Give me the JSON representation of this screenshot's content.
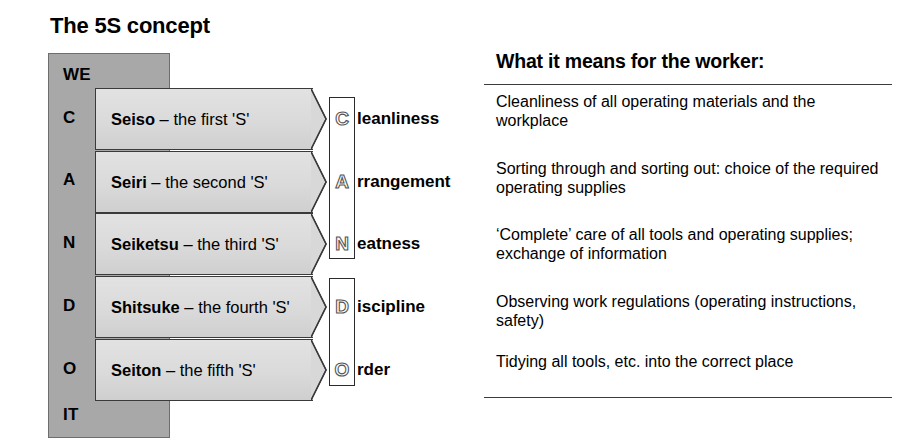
{
  "diagram": {
    "title": "The 5S concept",
    "acrostic_letters": [
      {
        "text": "WE",
        "top": 12
      },
      {
        "text": "C",
        "top": 55
      },
      {
        "text": "A",
        "top": 117
      },
      {
        "text": "N",
        "top": 180
      },
      {
        "text": "D",
        "top": 243
      },
      {
        "text": "O",
        "top": 306
      },
      {
        "text": "IT",
        "top": 352
      }
    ],
    "rows": [
      {
        "term": "Seiso",
        "separator": " – the first 'S'",
        "initial": "C",
        "word_rest": "leanliness",
        "top": 88
      },
      {
        "term": "Seiri",
        "separator": " – the second 'S'",
        "initial": "A",
        "word_rest": "rrangement",
        "top": 151
      },
      {
        "term": "Seiketsu",
        "separator": " – the third 'S'",
        "initial": "N",
        "word_rest": "eatness",
        "top": 213
      },
      {
        "term": "Shitsuke",
        "separator": " – the fourth 'S'",
        "initial": "D",
        "word_rest": "iscipline",
        "top": 276
      },
      {
        "term": "Seiton",
        "separator": " – the fifth 'S'",
        "initial": "O",
        "word_rest": "rder",
        "top": 339
      }
    ]
  },
  "panel": {
    "heading": "What it means for the worker:",
    "meanings": [
      "Cleanliness of all operating materials and the workplace",
      "Sorting through and sorting out:  choice of the required operating supplies",
      "‘Complete’ care of all tools and operating supplies; exchange of information",
      "Observing work regulations (operating instructions, safety)",
      "Tidying all tools, etc.  into the correct place"
    ]
  },
  "colors": {
    "column_fill": "#a8a8a8",
    "arrow_fill": "#dadada",
    "outline": "#2b2b2b",
    "text": "#000000",
    "background": "#ffffff"
  }
}
